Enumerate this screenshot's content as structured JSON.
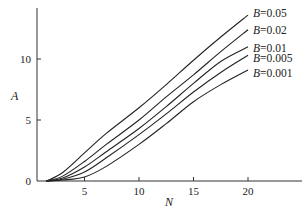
{
  "chart_data": {
    "type": "line",
    "title": "",
    "xlabel": "N",
    "ylabel": "A",
    "xlim": [
      0,
      25
    ],
    "ylim": [
      0,
      14.5
    ],
    "xticks": [
      5,
      10,
      15,
      20
    ],
    "yticks": [
      0,
      5,
      10
    ],
    "grid": false,
    "legend_position": "inline-right-end-of-curves",
    "x": [
      1.5,
      3,
      5,
      7,
      10,
      12.5,
      15,
      17.5,
      20
    ],
    "series": [
      {
        "name": "B=0.05",
        "label_var": "B",
        "label_val": "=0.05",
        "values": [
          0,
          0.7,
          2.3,
          3.9,
          6.0,
          7.9,
          9.9,
          11.8,
          13.6
        ],
        "label_y": 13
      },
      {
        "name": "B=0.02",
        "label_var": "B",
        "label_val": "=0.02",
        "values": [
          0,
          0.4,
          1.6,
          3.0,
          5.0,
          6.9,
          8.7,
          10.6,
          12.4
        ],
        "label_y": 30
      },
      {
        "name": "B=0.01",
        "label_var": "B",
        "label_val": "=0.01",
        "values": [
          0,
          0.25,
          1.15,
          2.4,
          4.3,
          6.1,
          8.0,
          9.8,
          11.0
        ],
        "label_y": 48
      },
      {
        "name": "B=0.005",
        "label_var": "B",
        "label_val": "=0.005",
        "values": [
          0,
          0.15,
          0.74,
          1.9,
          3.8,
          5.5,
          7.3,
          8.9,
          10.3
        ],
        "label_y": 58
      },
      {
        "name": "B=0.001",
        "label_var": "B",
        "label_val": "=0.001",
        "values": [
          0,
          0.08,
          0.33,
          1.2,
          3.0,
          4.7,
          6.5,
          7.9,
          9.1
        ],
        "label_y": 73
      }
    ]
  },
  "axes": {
    "x_label": "N",
    "y_label": "A",
    "x_tick_labels": [
      "5",
      "10",
      "15",
      "20"
    ],
    "y_tick_labels": [
      "0",
      "5",
      "10"
    ]
  }
}
